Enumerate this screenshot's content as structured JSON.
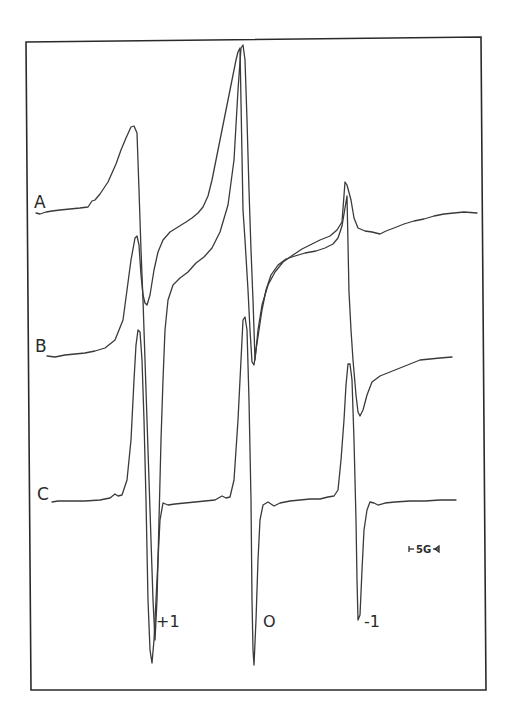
{
  "chart_data": {
    "type": "line",
    "title": "",
    "xlabel": "",
    "ylabel": "",
    "grid": false,
    "legend": "none",
    "x_units": "relative field position (G)",
    "peak_labels": [
      {
        "text": "+1",
        "line": "low-field"
      },
      {
        "text": "O",
        "line": "center-field"
      },
      {
        "text": "-1",
        "line": "high-field"
      }
    ],
    "scale_bar": {
      "text": "5G",
      "value_gauss": 5
    },
    "series": [
      {
        "name": "A",
        "label": "A",
        "description": "broad, immobilized-like spectrum with low-field max, tall center line, weak high-field feature",
        "lines": [
          {
            "position": "+1",
            "relative_max": 0.55,
            "relative_min": -0.5
          },
          {
            "position": "0",
            "relative_max": 1.0,
            "relative_min": -0.9
          },
          {
            "position": "-1",
            "relative_max": 0.22,
            "relative_min": -0.1
          }
        ]
      },
      {
        "name": "B",
        "label": "B",
        "description": "intermediate mobility spectrum, three resolved lines",
        "lines": [
          {
            "position": "+1",
            "relative_max": 0.72,
            "relative_min": 0.32
          },
          {
            "position": "0",
            "relative_max": 0.85,
            "relative_min": -0.06
          },
          {
            "position": "-1",
            "relative_max": 0.38,
            "relative_min": -0.36
          }
        ]
      },
      {
        "name": "C",
        "label": "C",
        "description": "sharp, mobile three-line spectrum",
        "lines": [
          {
            "position": "+1",
            "relative_max": 1.0,
            "relative_min": -0.95
          },
          {
            "position": "0",
            "relative_max": 1.05,
            "relative_min": -0.97
          },
          {
            "position": "-1",
            "relative_max": 0.82,
            "relative_min": -0.72
          }
        ]
      }
    ]
  },
  "labels": {
    "trace_a": "A",
    "trace_b": "B",
    "trace_c": "C",
    "peak_plus1": "+1",
    "peak_zero": "O",
    "peak_minus1": "-1",
    "scale": "5G"
  }
}
